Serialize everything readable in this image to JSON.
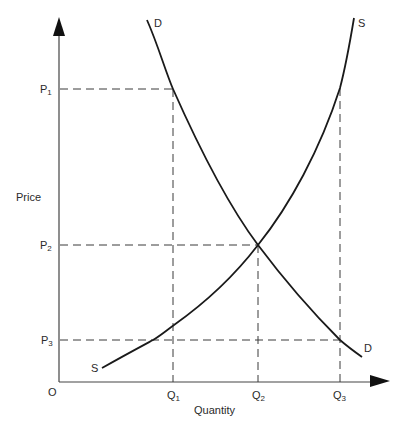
{
  "diagram": {
    "axes": {
      "y_label": "Price",
      "x_label": "Quantity",
      "origin_label": "O"
    },
    "curves": {
      "demand": {
        "label_top": "D",
        "label_bottom": "D"
      },
      "supply": {
        "label_top": "S",
        "label_bottom": "S"
      }
    },
    "price_levels": [
      {
        "base": "P",
        "sub": "1"
      },
      {
        "base": "P",
        "sub": "2"
      },
      {
        "base": "P",
        "sub": "3"
      }
    ],
    "quantity_levels": [
      {
        "base": "Q",
        "sub": "1"
      },
      {
        "base": "Q",
        "sub": "2"
      },
      {
        "base": "Q",
        "sub": "3"
      }
    ],
    "colors": {
      "line": "#1a1a1a",
      "dash": "#3a3a3a",
      "text": "#2a2a2a"
    }
  }
}
